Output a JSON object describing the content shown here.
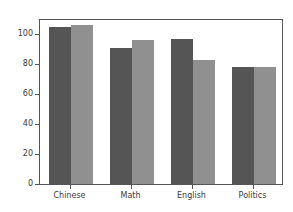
{
  "chart_data": {
    "type": "bar",
    "title": "",
    "xlabel": "",
    "ylabel": "",
    "categories": [
      "Chinese",
      "Math",
      "English",
      "Politics"
    ],
    "series": [
      {
        "name": "series-1",
        "color": "#555555",
        "values": [
          105,
          91,
          97,
          78.5
        ]
      },
      {
        "name": "series-2",
        "color": "#909090",
        "values": [
          106,
          96,
          83,
          78.5
        ]
      }
    ],
    "ylim": [
      0,
      111
    ],
    "yticks": [
      0,
      20,
      40,
      60,
      80,
      100
    ],
    "ytick_labels": [
      "0",
      "20",
      "40",
      "60",
      "80",
      "100"
    ],
    "grid": false,
    "legend": "none",
    "background": "#ffffff",
    "axis_color": "#555555",
    "tick_label_color": "#3b3b3b"
  }
}
